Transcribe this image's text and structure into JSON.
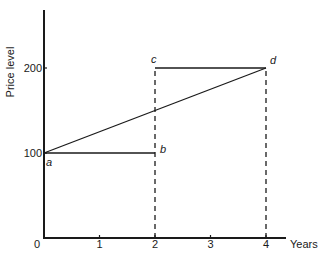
{
  "chart_data": {
    "type": "line",
    "title": "",
    "xlabel": "Years",
    "ylabel": "Price level",
    "xlim": [
      0,
      4.6
    ],
    "ylim": [
      0,
      275
    ],
    "x_ticks": [
      0,
      1,
      2,
      3,
      4
    ],
    "x_tick_labels": [
      "0",
      "1",
      "2",
      "3",
      "4"
    ],
    "y_ticks": [
      100,
      200
    ],
    "y_tick_labels": [
      "100",
      "200"
    ],
    "grid": false,
    "legend": "none",
    "points": [
      {
        "label": "a",
        "x": 0,
        "y": 100
      },
      {
        "label": "b",
        "x": 2,
        "y": 100
      },
      {
        "label": "c",
        "x": 2,
        "y": 200
      },
      {
        "label": "d",
        "x": 4,
        "y": 200
      }
    ],
    "series": [
      {
        "name": "a-b",
        "style": "solid",
        "x": [
          0,
          2
        ],
        "y": [
          100,
          100
        ]
      },
      {
        "name": "c-d",
        "style": "solid",
        "x": [
          2,
          4
        ],
        "y": [
          200,
          200
        ]
      },
      {
        "name": "a-d",
        "style": "solid",
        "x": [
          0,
          4
        ],
        "y": [
          100,
          200
        ]
      },
      {
        "name": "drop-2",
        "style": "dashed",
        "x": [
          2,
          2
        ],
        "y": [
          0,
          200
        ]
      },
      {
        "name": "drop-4",
        "style": "dashed",
        "x": [
          4,
          4
        ],
        "y": [
          0,
          200
        ]
      }
    ]
  }
}
